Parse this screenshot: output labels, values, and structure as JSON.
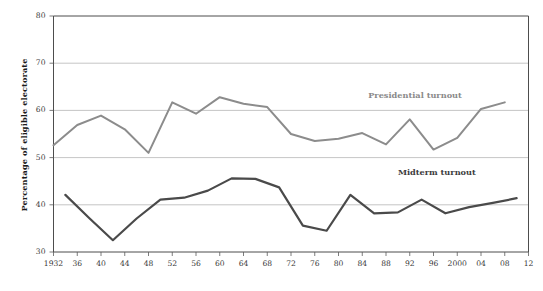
{
  "chart_data": {
    "type": "line",
    "title": "",
    "xlabel": "",
    "ylabel": "Percentage of eligible electorate",
    "xlim": [
      1932,
      2012
    ],
    "ylim": [
      30,
      80
    ],
    "yticks": [
      30,
      40,
      50,
      60,
      70,
      80
    ],
    "ytick_labels": [
      "30",
      "40",
      "50",
      "60",
      "70",
      "80"
    ],
    "xticks": [
      1932,
      1936,
      1940,
      1944,
      1948,
      1952,
      1956,
      1960,
      1964,
      1968,
      1972,
      1976,
      1980,
      1984,
      1988,
      1992,
      1996,
      2000,
      2004,
      2008,
      2012
    ],
    "xtick_labels": [
      "1932",
      "36",
      "40",
      "44",
      "48",
      "52",
      "56",
      "60",
      "64",
      "68",
      "72",
      "76",
      "80",
      "84",
      "88",
      "92",
      "96",
      "2000",
      "04",
      "08",
      "12"
    ],
    "grid": "horizontal",
    "legend_position": "inline-annotations",
    "series": [
      {
        "name": "Presidential turnout",
        "color": "#8c8c8c",
        "label_x": 1985,
        "label_y": 63.2,
        "x": [
          1932,
          1936,
          1940,
          1944,
          1948,
          1952,
          1956,
          1960,
          1964,
          1968,
          1972,
          1976,
          1980,
          1984,
          1988,
          1992,
          1996,
          2000,
          2004,
          2008
        ],
        "values": [
          52.6,
          56.9,
          58.9,
          56.0,
          51.0,
          61.7,
          59.3,
          62.8,
          61.4,
          60.7,
          55.0,
          53.5,
          54.0,
          55.2,
          52.8,
          58.1,
          51.7,
          54.2,
          60.3,
          61.7
        ]
      },
      {
        "name": "Midterm turnout",
        "color": "#4a4a4a",
        "label_x": 1990,
        "label_y": 47.0,
        "x": [
          1934,
          1938,
          1942,
          1946,
          1950,
          1954,
          1958,
          1962,
          1966,
          1970,
          1974,
          1978,
          1982,
          1986,
          1990,
          1994,
          1998,
          2002,
          2006,
          2010
        ],
        "values": [
          42.1,
          37.2,
          32.5,
          37.1,
          41.1,
          41.5,
          43.0,
          45.6,
          45.5,
          43.7,
          35.6,
          34.5,
          42.1,
          38.2,
          38.4,
          41.1,
          38.2,
          39.5,
          40.4,
          41.4
        ]
      }
    ]
  },
  "axis": {
    "y_title": "Percentage of eligible electorate"
  }
}
